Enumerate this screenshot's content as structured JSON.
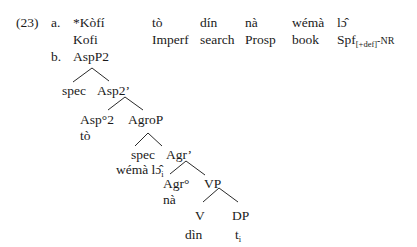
{
  "example": {
    "number": "(23)",
    "a": {
      "label": "a.",
      "words": [
        "*Kòfí",
        "tò",
        "dín",
        "nà",
        "wémà",
        "lɔ̂"
      ],
      "glosses": [
        "Kofi",
        "Imperf",
        "search",
        "Prosp",
        "book",
        "Spf"
      ],
      "last_gloss_subscript": "[+def]",
      "last_gloss_suffix": "-NR"
    },
    "b": {
      "label": "b.",
      "tree": {
        "root": "AspP2",
        "spec1": "spec",
        "asp2bar": "Asp2’",
        "asp_head": "Asp°2",
        "asp_head_word": "tò",
        "agrop": "AgroP",
        "spec2": "spec",
        "spec2_word": "wémà lɔ̂",
        "spec2_index": "i",
        "agrbar": "Agr’",
        "agr_head": "Agr°",
        "agr_head_word": "nà",
        "vp": "VP",
        "v": "V",
        "v_word": "dìn",
        "dp": "DP",
        "trace": "t",
        "trace_index": "i"
      }
    }
  }
}
